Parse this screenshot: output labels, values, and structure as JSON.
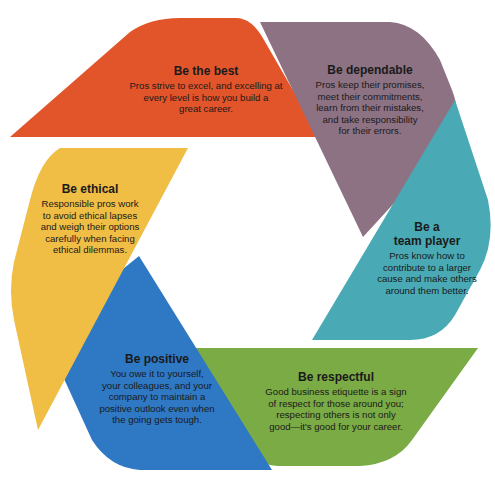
{
  "diagram": {
    "type": "hexagon-cycle",
    "segments": [
      {
        "id": "be-the-best",
        "title": "Be the best",
        "body": [
          "Pros strive to excel, and excelling at",
          "every level is how you build a",
          "great career."
        ],
        "color": "#e2552b"
      },
      {
        "id": "be-dependable",
        "title": "Be dependable",
        "body": [
          "Pros keep their promises,",
          "meet their commitments,",
          "learn from their mistakes,",
          "and take responsibility",
          "for their errors."
        ],
        "color": "#8d7284"
      },
      {
        "id": "be-a-team-player",
        "title_lines": [
          "Be a",
          "team player"
        ],
        "body": [
          "Pros know how to",
          "contribute to a larger",
          "cause and make others",
          "around them better."
        ],
        "color": "#49aab5"
      },
      {
        "id": "be-respectful",
        "title": "Be respectful",
        "body": [
          "Good business etiquette is a sign",
          "of respect for those around you;",
          "respecting others is not only",
          "good—it's good for your career."
        ],
        "color": "#7aab45"
      },
      {
        "id": "be-positive",
        "title": "Be positive",
        "body": [
          "You owe it to yourself,",
          "your colleagues, and your",
          "company to maintain a",
          "positive outlook even when",
          "the going gets tough."
        ],
        "color": "#2f78c4"
      },
      {
        "id": "be-ethical",
        "title": "Be ethical",
        "body": [
          "Responsible pros work",
          "to avoid ethical lapses",
          "and weigh their options",
          "carefully when facing",
          "ethical dilemmas."
        ],
        "color": "#f0bd45"
      }
    ]
  }
}
